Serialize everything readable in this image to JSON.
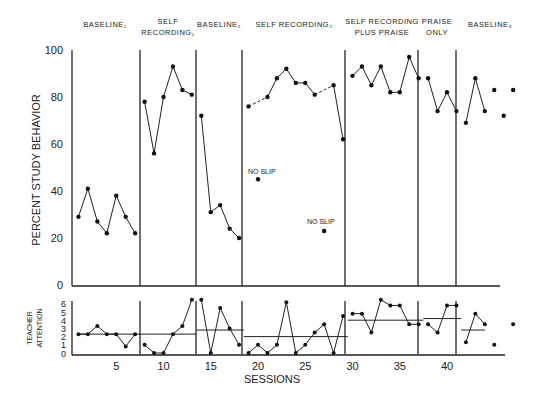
{
  "chart_data": [
    {
      "type": "line",
      "title": "",
      "xlabel": "SESSIONS",
      "ylabel": "PERCENT STUDY BEHAVIOR",
      "ylim": [
        0,
        100
      ],
      "yticks": [
        0,
        20,
        40,
        60,
        80,
        100
      ],
      "xticks": [
        5,
        10,
        15,
        20,
        25,
        30,
        35,
        40
      ],
      "grid": false,
      "phases": [
        {
          "label": "BASELINE₁",
          "sessions": [
            1,
            7
          ]
        },
        {
          "label": "SELF RECORDING₁",
          "sessions": [
            8,
            13
          ]
        },
        {
          "label": "BASELINE₂",
          "sessions": [
            14,
            18
          ]
        },
        {
          "label": "SELF RECORDING₂",
          "sessions": [
            19,
            29
          ]
        },
        {
          "label": "SELF RECORDING PLUS PRAISE",
          "sessions": [
            30,
            37
          ]
        },
        {
          "label": "PRAISE ONLY",
          "sessions": [
            38,
            41
          ]
        },
        {
          "label": "BASELINE₃",
          "sessions": [
            42,
            46
          ]
        }
      ],
      "phase_lines": [
        7.5,
        13.5,
        18.5,
        29.5,
        37.5,
        41.5
      ],
      "series": [
        {
          "name": "Baseline 1",
          "x": [
            1,
            2,
            3,
            4,
            5,
            6,
            7
          ],
          "values": [
            29,
            41,
            27,
            22,
            38,
            29,
            22
          ]
        },
        {
          "name": "Self Recording 1",
          "x": [
            8,
            9,
            10,
            11,
            12,
            13
          ],
          "values": [
            78,
            56,
            80,
            93,
            83,
            81
          ]
        },
        {
          "name": "Baseline 2",
          "x": [
            14,
            15,
            16,
            17,
            18
          ],
          "values": [
            72,
            31,
            34,
            24,
            20
          ]
        },
        {
          "name": "Self Recording 2",
          "x": [
            19,
            21,
            22,
            23,
            24,
            25,
            26,
            28,
            29
          ],
          "values": [
            76,
            80,
            88,
            92,
            86,
            86,
            81,
            85,
            62
          ],
          "dashed_segments": [
            [
              19,
              21
            ],
            [
              26,
              28
            ]
          ]
        },
        {
          "name": "Self Recording plus Praise",
          "x": [
            30,
            31,
            32,
            33,
            34,
            35,
            36,
            37
          ],
          "values": [
            89,
            93,
            85,
            93,
            82,
            82,
            97,
            88
          ]
        },
        {
          "name": "Praise Only",
          "x": [
            38,
            39,
            40,
            41
          ],
          "values": [
            88,
            74,
            82,
            74
          ]
        },
        {
          "name": "Baseline 3",
          "x": [
            42,
            43,
            44
          ],
          "values": [
            69,
            88,
            74
          ]
        },
        {
          "name": "Baseline 3 (unconnected)",
          "x": [
            45,
            46,
            47
          ],
          "values": [
            83,
            72,
            83
          ]
        },
        {
          "name": "No Slip",
          "x": [
            20,
            27
          ],
          "values": [
            45,
            23
          ]
        }
      ],
      "annotations": [
        "NO SLIP",
        "NO SLIP"
      ]
    },
    {
      "type": "line",
      "xlabel": "SESSIONS",
      "ylabel": "TEACHER ATTENTION",
      "ylim": [
        0,
        6
      ],
      "yticks": [
        0,
        1,
        2,
        3,
        4,
        5,
        6
      ],
      "series": [
        {
          "name": "Teacher attention",
          "x": [
            1,
            2,
            3,
            4,
            5,
            6,
            7,
            8,
            9,
            10,
            11,
            12,
            13,
            14,
            15,
            16,
            17,
            18,
            19,
            20,
            21,
            22,
            23,
            24,
            25,
            26,
            27,
            28,
            29,
            30,
            31,
            32,
            33,
            34,
            35,
            36,
            37,
            38,
            39,
            40,
            41,
            42,
            43,
            44,
            45,
            46,
            47
          ],
          "values": [
            2.3,
            2.3,
            3.3,
            2.3,
            2.3,
            0.8,
            2.3,
            1,
            0,
            0,
            2.3,
            3.3,
            6.5,
            6.5,
            0,
            5.5,
            3,
            1,
            0,
            1,
            0,
            1,
            6.2,
            0,
            1,
            2.5,
            3.5,
            0,
            4.5,
            4.8,
            4.8,
            2.5,
            6.5,
            5.8,
            5.8,
            3.5,
            3.5,
            3.5,
            2.5,
            5.8,
            5.8,
            1.3,
            4.8,
            3.5,
            1,
            null,
            3.5
          ]
        },
        {
          "name": "Phase means",
          "segments": [
            {
              "sessions": [
                1,
                7.5
              ],
              "value": 2.3
            },
            {
              "sessions": [
                7.5,
                13.5
              ],
              "value": 2.3
            },
            {
              "sessions": [
                13.5,
                18.5
              ],
              "value": 2.8
            },
            {
              "sessions": [
                18.5,
                29.5
              ],
              "value": 2.0
            },
            {
              "sessions": [
                29.5,
                37.5
              ],
              "value": 4.0
            },
            {
              "sessions": [
                37.5,
                41.5
              ],
              "value": 4.2
            },
            {
              "sessions": [
                41.5,
                44
              ],
              "value": 2.8
            }
          ]
        }
      ]
    }
  ],
  "labels": {
    "phase_headers": [
      {
        "line1": "BASELINE₁",
        "line2": ""
      },
      {
        "line1": "SELF",
        "line2": "RECORDING₁"
      },
      {
        "line1": "BASELINE₂",
        "line2": ""
      },
      {
        "line1": "SELF RECORDING₂",
        "line2": ""
      },
      {
        "line1": "SELF RECORDING",
        "line2": "PLUS PRAISE"
      },
      {
        "line1": "PRAISE",
        "line2": "ONLY"
      },
      {
        "line1": "BASELINE₃",
        "line2": ""
      }
    ],
    "y_main": "PERCENT STUDY BEHAVIOR",
    "y_lower_1": "TEACHER",
    "y_lower_2": "ATTENTION",
    "x_label": "SESSIONS",
    "no_slip": "NO SLIP"
  }
}
